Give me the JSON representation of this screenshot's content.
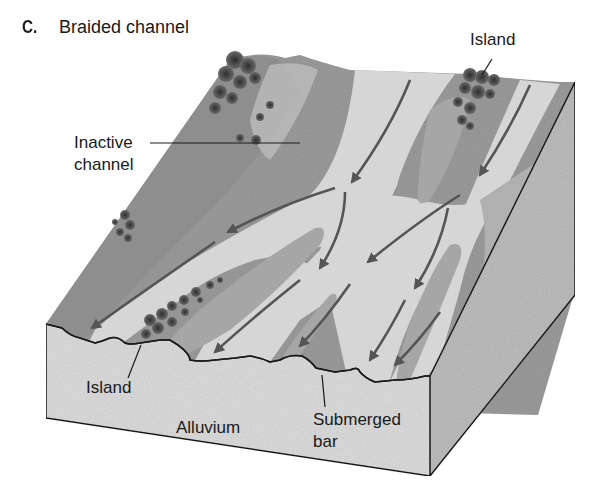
{
  "figure": {
    "panel_letter": "C.",
    "title": "Braided channel"
  },
  "labels": {
    "island_top": "Island",
    "inactive_channel_line1": "Inactive",
    "inactive_channel_line2": "channel",
    "island_bottom": "Island",
    "alluvium": "Alluvium",
    "submerged_bar_line1": "Submerged",
    "submerged_bar_line2": "bar"
  },
  "colors": {
    "background": "#ffffff",
    "block_side": "#dcdcdc",
    "block_right_side": "#bdbdbd",
    "floodplain": "#9a9a9a",
    "channel_water": "#d2d2d2",
    "bar": "#a8a8a8",
    "vegetation": "#3a3a3a",
    "arrow": "#555555",
    "outline": "#1a1a1a"
  }
}
